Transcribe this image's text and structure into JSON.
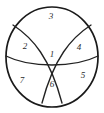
{
  "figure": {
    "type": "venn-like-partitioned-circle",
    "title": "",
    "background_color": "#ffffff",
    "stroke_color": "#222222",
    "label_color": "#2b2b2b",
    "circle": {
      "cx": 52,
      "cy": 57,
      "rx": 46,
      "ry": 50
    },
    "regions": [
      {
        "id": "top",
        "label": "3",
        "x": 51,
        "y": 17
      },
      {
        "id": "left",
        "label": "2",
        "x": 25,
        "y": 47
      },
      {
        "id": "right",
        "label": "4",
        "x": 79,
        "y": 48
      },
      {
        "id": "center",
        "label": "1",
        "x": 52,
        "y": 55
      },
      {
        "id": "bottom-left",
        "label": "7",
        "x": 22,
        "y": 81
      },
      {
        "id": "bottom-center",
        "label": "6",
        "x": 52,
        "y": 85
      },
      {
        "id": "bottom-right",
        "label": "5",
        "x": 83,
        "y": 76
      }
    ],
    "curves": [
      {
        "id": "arc-left-to-right",
        "d": "M 13 25 C 33 38, 50 58, 62 103"
      },
      {
        "id": "arc-right-to-left",
        "d": "M 91 25 C 71 38, 54 58, 42 103"
      },
      {
        "id": "horizontal-divider",
        "d": "M 6 56 C 30 68, 74 68, 98 56"
      }
    ]
  }
}
